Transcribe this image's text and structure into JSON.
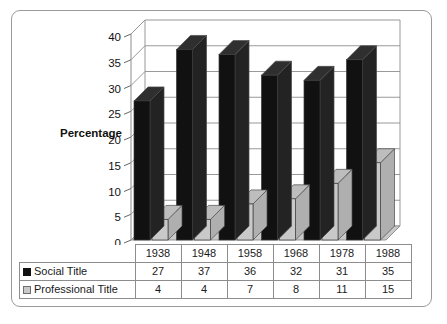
{
  "chart_data": {
    "type": "bar",
    "title": "",
    "subtitle": "",
    "xlabel": "",
    "ylabel": "Percentage",
    "ylim": [
      0,
      40
    ],
    "ytick_step": 5,
    "yticks": [
      "0",
      "5",
      "10",
      "15",
      "20",
      "25",
      "30",
      "35",
      "40"
    ],
    "grid": true,
    "three_d": true,
    "legend_position": "bottom-table",
    "categories": [
      "1938",
      "1948",
      "1958",
      "1968",
      "1978",
      "1988"
    ],
    "series": [
      {
        "name": "Social Title",
        "values": [
          27,
          37,
          36,
          32,
          31,
          35
        ],
        "color": "#111111"
      },
      {
        "name": "Professional Title",
        "values": [
          4,
          4,
          7,
          8,
          11,
          15
        ],
        "color": "#c9c9c9"
      }
    ]
  },
  "table": {
    "corner_label": "",
    "header": [
      "1938",
      "1948",
      "1958",
      "1968",
      "1978",
      "1988"
    ],
    "rows": [
      {
        "label": "Social Title",
        "swatch": "black-swatch-icon",
        "values": [
          "27",
          "37",
          "36",
          "32",
          "31",
          "35"
        ]
      },
      {
        "label": "Professional Title",
        "swatch": "gray-swatch-icon",
        "values": [
          "4",
          "4",
          "7",
          "8",
          "11",
          "15"
        ]
      }
    ]
  },
  "axis": {
    "y_title": "Percentage",
    "y_labels": [
      "40",
      "35",
      "30",
      "25",
      "20",
      "15",
      "10",
      "5",
      "0"
    ],
    "x_labels": [
      "1938",
      "1948",
      "1958",
      "1968",
      "1978",
      "1988"
    ]
  },
  "colors": {
    "series_social": "#111111",
    "series_professional": "#c9c9c9",
    "frame_border": "#9a9a9a",
    "gridline": "#8d8d8d",
    "floor": "#c9c9c9",
    "wall": "#ffffff"
  }
}
